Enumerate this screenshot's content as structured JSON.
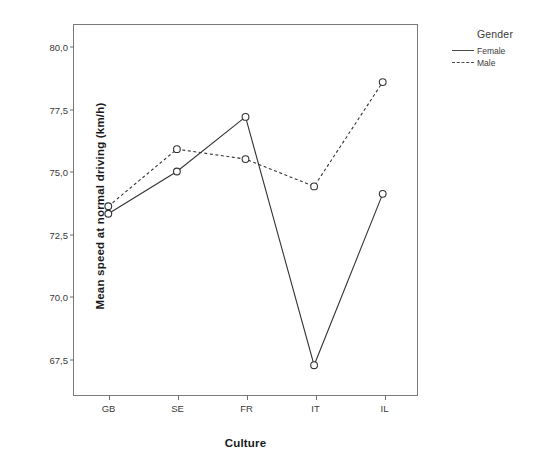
{
  "chart_data": {
    "type": "line",
    "title": "",
    "xlabel": "Culture",
    "ylabel": "Mean speed at normal driving (km/h)",
    "categories": [
      "GB",
      "SE",
      "FR",
      "IT",
      "IL"
    ],
    "ytick_labels": [
      "80,0",
      "77,5",
      "75,0",
      "72,5",
      "70,0",
      "67,5"
    ],
    "ytick_values": [
      80.0,
      77.5,
      75.0,
      72.5,
      70.0,
      67.5
    ],
    "ylim": [
      66.0,
      80.9
    ],
    "grid": false,
    "legend_position": "right",
    "legend_title": "Gender",
    "series": [
      {
        "name": "Female",
        "style": "solid",
        "marker": "open-circle",
        "color": "#333333",
        "values": [
          73.3,
          75.0,
          77.2,
          67.2,
          74.1
        ]
      },
      {
        "name": "Male",
        "style": "dashed",
        "marker": "open-circle",
        "color": "#333333",
        "values": [
          73.6,
          75.9,
          75.5,
          74.4,
          78.6
        ]
      }
    ]
  },
  "legend": {
    "title": "Gender",
    "entries": [
      {
        "label": "Female",
        "style": "solid"
      },
      {
        "label": "Male",
        "style": "dashed"
      }
    ]
  },
  "axes": {
    "x_label": "Culture",
    "y_label": "Mean speed at normal driving (km/h)"
  }
}
